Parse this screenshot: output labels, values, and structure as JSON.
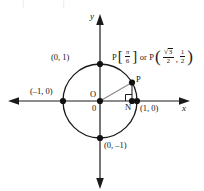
{
  "figure": {
    "type": "unit-circle-diagram",
    "axes": {
      "x_label": "x",
      "y_label": "y"
    },
    "origin": {
      "letter": "O",
      "zero": "0"
    },
    "circle": {
      "center": [
        100,
        101
      ],
      "radius_px": 37,
      "stroke": "#1a1a1a"
    },
    "marked_points": [
      {
        "name": "top",
        "label": "(0, 1)",
        "coords": [
          0,
          1
        ]
      },
      {
        "name": "left",
        "label": "(–1, 0)",
        "coords": [
          -1,
          0
        ]
      },
      {
        "name": "right",
        "label": "(1, 0)",
        "coords": [
          1,
          0
        ]
      },
      {
        "name": "bottom",
        "label": "(0, –1)",
        "coords": [
          0,
          -1
        ]
      },
      {
        "name": "foot",
        "label": "N",
        "coords": [
          0.866,
          0
        ]
      },
      {
        "name": "point-p",
        "label": "P",
        "coords": [
          0.866,
          0.5
        ]
      }
    ],
    "annotation": {
      "p_first": "P",
      "angle_num": "π",
      "angle_den": "6",
      "bracket_open": "[",
      "bracket_close": "]",
      "or": "or",
      "p_second": "P",
      "paren_open": "(",
      "paren_close": ")",
      "x_num_radical": "√",
      "x_num_body": "3",
      "x_den": "2",
      "separator": ",",
      "y_num": "1",
      "y_den": "2"
    },
    "colors": {
      "ink": "#1a1a1a",
      "radius_line": "#8c8c8c",
      "background": "#ffffff"
    },
    "artifacts": {
      "top_left_1": "\\",
      "top_left_2": "/"
    }
  }
}
